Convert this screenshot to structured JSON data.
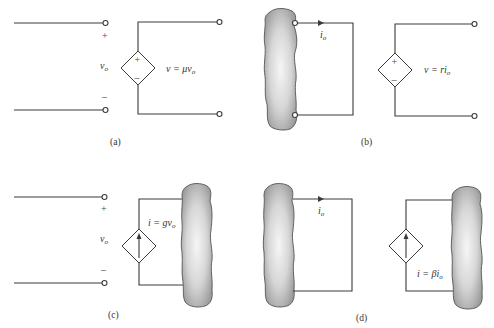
{
  "panels": {
    "a": {
      "caption": "(a)",
      "control_label": "v",
      "control_sub": "o",
      "plus": "+",
      "minus": "–",
      "source_type": "dependent-voltage-source",
      "source_plus": "+",
      "source_minus": "–",
      "equation_lhs": "v = ",
      "equation_coef": "μv",
      "equation_sub": "o"
    },
    "b": {
      "caption": "(b)",
      "current_label": "i",
      "current_sub": "o",
      "source_type": "dependent-voltage-source",
      "source_plus": "+",
      "source_minus": "–",
      "equation_lhs": "v = ",
      "equation_coef": "ri",
      "equation_sub": "o"
    },
    "c": {
      "caption": "(c)",
      "control_label": "v",
      "control_sub": "o",
      "plus": "+",
      "minus": "–",
      "source_type": "dependent-current-source",
      "equation_lhs": "i = ",
      "equation_coef": "gv",
      "equation_sub": "o"
    },
    "d": {
      "caption": "(d)",
      "current_label": "i",
      "current_sub": "o",
      "source_type": "dependent-current-source",
      "equation_lhs": "i = ",
      "equation_coef": "βi",
      "equation_sub": "o"
    }
  },
  "colors": {
    "wire": "#3a3a3a",
    "blob_fill_center": "#f4f4f4",
    "blob_fill_edge": "#9a9a9a",
    "background": "#ffffff"
  }
}
